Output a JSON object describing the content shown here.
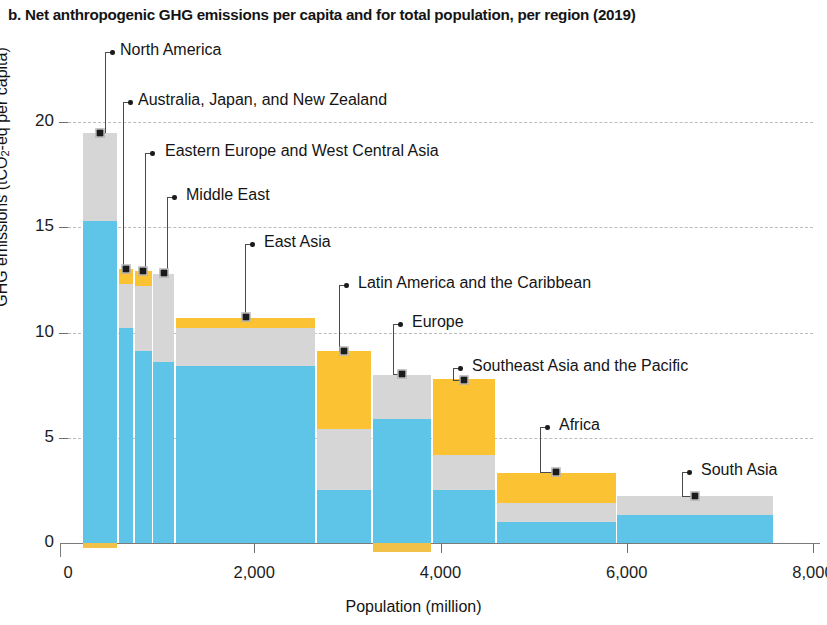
{
  "title": "b. Net anthropogenic GHG emissions per capita and for total population, per region (2019)",
  "axes": {
    "y_title_pre": "GHG emissions (tCO",
    "y_title_sub": "2",
    "y_title_post": "-eq per capita)",
    "y_ticks": [
      "0",
      "5",
      "10",
      "15",
      "20"
    ],
    "x_title": "Population (million)",
    "x_ticks": [
      "0",
      "2,000",
      "4,000",
      "6,000",
      "8,000"
    ]
  },
  "colors": {
    "blue": "#5ec5e8",
    "grey": "#d6d6d6",
    "yellow": "#fbc233",
    "marker": "#1b1b1b",
    "gridline": "#bcbcbc",
    "axis": "#6e6e6e"
  },
  "chart_data": {
    "type": "bar",
    "variant": "variable-width stacked (marimekko)",
    "title": "b. Net anthropogenic GHG emissions per capita and for total population, per region (2019)",
    "xlabel": "Population (million)",
    "ylabel": "GHG emissions (tCO2-eq per capita)",
    "xlim": [
      0,
      8000
    ],
    "ylim": [
      -0.6,
      20.5
    ],
    "grid": "horizontal dashed",
    "legend": "none (direct labels with leader lines)",
    "series": [
      {
        "name": "blue segment",
        "color": "#5ec5e8"
      },
      {
        "name": "grey segment",
        "color": "#d6d6d6"
      },
      {
        "name": "yellow segment",
        "color": "#fbc233"
      }
    ],
    "regions": [
      {
        "label": "North America",
        "pop_start": 160,
        "pop_end": 528,
        "population": 368,
        "blue": 15.3,
        "grey": 4.2,
        "yellow": 0.0,
        "negative": -0.25,
        "total": 19.5
      },
      {
        "label": "Australia, Japan, and New Zealand",
        "pop_start": 546,
        "pop_end": 700,
        "population": 154,
        "blue": 10.2,
        "grey": 2.1,
        "yellow": 0.7,
        "negative": 0.0,
        "total": 13.0
      },
      {
        "label": "Eastern Europe and West Central Asia",
        "pop_start": 716,
        "pop_end": 900,
        "population": 184,
        "blue": 9.1,
        "grey": 3.1,
        "yellow": 0.7,
        "negative": 0.0,
        "total": 12.9
      },
      {
        "label": "Middle East",
        "pop_start": 918,
        "pop_end": 1140,
        "population": 222,
        "blue": 8.6,
        "grey": 4.2,
        "yellow": 0.0,
        "negative": 0.0,
        "total": 12.8
      },
      {
        "label": "East Asia",
        "pop_start": 1158,
        "pop_end": 2655,
        "population": 1497,
        "blue": 8.4,
        "grey": 1.8,
        "yellow": 0.5,
        "negative": 0.0,
        "total": 10.7
      },
      {
        "label": "Latin America and the Caribbean",
        "pop_start": 2673,
        "pop_end": 3255,
        "population": 582,
        "blue": 2.5,
        "grey": 2.9,
        "yellow": 3.7,
        "negative": 0.0,
        "total": 9.1
      },
      {
        "label": "Europe",
        "pop_start": 3273,
        "pop_end": 3900,
        "population": 627,
        "blue": 5.9,
        "grey": 2.1,
        "yellow": 0.0,
        "negative": -0.45,
        "total": 8.0
      },
      {
        "label": "Southeast Asia and the Pacific",
        "pop_start": 3918,
        "pop_end": 4590,
        "population": 672,
        "blue": 2.5,
        "grey": 1.7,
        "yellow": 3.6,
        "negative": 0.0,
        "total": 7.8
      },
      {
        "label": "Africa",
        "pop_start": 4608,
        "pop_end": 5880,
        "population": 1272,
        "blue": 1.0,
        "grey": 0.9,
        "yellow": 1.45,
        "negative": 0.0,
        "total": 3.35
      },
      {
        "label": "South Asia",
        "pop_start": 5898,
        "pop_end": 7570,
        "population": 1672,
        "blue": 1.35,
        "grey": 0.9,
        "yellow": 0.0,
        "negative": 0.0,
        "total": 2.25
      }
    ]
  },
  "callouts": [
    {
      "label": "North America",
      "text_x": 120,
      "text_y": 41,
      "dot_x": 112,
      "dot_y": 52,
      "elbow_x": 105,
      "marker_y": 133
    },
    {
      "label": "Australia, Japan, and New Zealand",
      "text_x": 138,
      "text_y": 91,
      "dot_x": 130,
      "dot_y": 102,
      "elbow_x": 123,
      "marker_y": 269
    },
    {
      "label": "Eastern Europe and West Central Asia",
      "text_x": 165,
      "text_y": 142,
      "dot_x": 152,
      "dot_y": 153,
      "elbow_x": 145,
      "marker_y": 271
    },
    {
      "label": "Middle East",
      "text_x": 186,
      "text_y": 186,
      "dot_x": 174,
      "dot_y": 197,
      "elbow_x": 167,
      "marker_y": 273
    },
    {
      "label": "East Asia",
      "text_x": 264,
      "text_y": 233,
      "dot_x": 252,
      "dot_y": 244,
      "elbow_x": 245,
      "marker_y": 317
    },
    {
      "label": "Latin America and the Caribbean",
      "text_x": 358,
      "text_y": 274,
      "dot_x": 346,
      "dot_y": 285,
      "elbow_x": 339,
      "marker_y": 351
    },
    {
      "label": "Europe",
      "text_x": 412,
      "text_y": 313,
      "dot_x": 400,
      "dot_y": 324,
      "elbow_x": 393,
      "marker_y": 374
    },
    {
      "label": "Southeast Asia and the Pacific",
      "text_x": 472,
      "text_y": 357,
      "dot_x": 460,
      "dot_y": 368,
      "elbow_x": 453,
      "marker_y": 380
    },
    {
      "label": "Africa",
      "text_x": 559,
      "text_y": 416,
      "dot_x": 547,
      "dot_y": 427,
      "elbow_x": 540,
      "marker_y": 472
    },
    {
      "label": "South Asia",
      "text_x": 701,
      "text_y": 461,
      "dot_x": 689,
      "dot_y": 472,
      "elbow_x": 682,
      "marker_y": 496
    }
  ]
}
